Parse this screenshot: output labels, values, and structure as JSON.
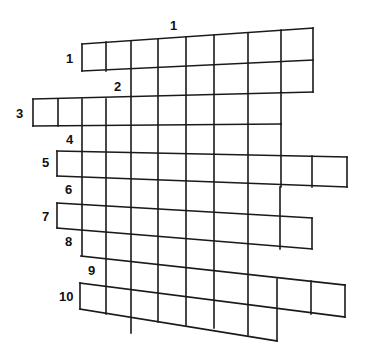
{
  "puzzle": {
    "type": "crossword",
    "stroke_color": "#1a1a1a",
    "background": "#ffffff"
  },
  "labels": [
    {
      "id": "v1",
      "text": "1",
      "direction": "vertical",
      "x": 170,
      "y": 19
    },
    {
      "id": "h1",
      "text": "1",
      "direction": "horizontal",
      "x": 66,
      "y": 52
    },
    {
      "id": "v2",
      "text": "2",
      "direction": "vertical",
      "x": 114,
      "y": 80
    },
    {
      "id": "h3",
      "text": "3",
      "direction": "horizontal",
      "x": 16,
      "y": 107
    },
    {
      "id": "h4",
      "text": "4",
      "direction": "horizontal",
      "x": 66,
      "y": 133
    },
    {
      "id": "h5",
      "text": "5",
      "direction": "horizontal",
      "x": 42,
      "y": 156
    },
    {
      "id": "h6",
      "text": "6",
      "direction": "horizontal",
      "x": 65,
      "y": 183
    },
    {
      "id": "h7",
      "text": "7",
      "direction": "horizontal",
      "x": 42,
      "y": 210
    },
    {
      "id": "h8",
      "text": "8",
      "direction": "horizontal",
      "x": 65,
      "y": 235
    },
    {
      "id": "h9",
      "text": "9",
      "direction": "horizontal",
      "x": 88,
      "y": 264
    },
    {
      "id": "h10",
      "text": "10",
      "direction": "horizontal",
      "x": 59,
      "y": 290
    }
  ],
  "grid_lines": {
    "horizontal": [
      [
        82,
        44,
        313,
        28
      ],
      [
        82,
        71,
        313,
        60
      ],
      [
        33,
        99,
        313,
        92
      ],
      [
        33,
        126,
        281,
        124
      ],
      [
        57,
        151,
        347,
        157
      ],
      [
        57,
        176,
        347,
        187
      ],
      [
        57,
        203,
        312,
        218
      ],
      [
        57,
        228,
        312,
        249
      ],
      [
        81,
        256,
        345,
        285
      ],
      [
        80,
        283,
        345,
        317
      ],
      [
        80,
        309,
        277,
        341
      ]
    ],
    "vertical": [
      [
        82,
        44,
        82,
        71
      ],
      [
        106,
        42,
        106,
        71
      ],
      [
        131,
        41,
        131,
        333
      ],
      [
        158,
        39,
        158,
        322
      ],
      [
        186,
        37,
        186,
        325
      ],
      [
        214,
        35,
        214,
        328
      ],
      [
        248,
        33,
        248,
        335
      ],
      [
        281,
        30,
        281,
        92
      ],
      [
        313,
        28,
        313,
        92
      ],
      [
        33,
        99,
        33,
        126
      ],
      [
        58,
        99,
        58,
        126
      ],
      [
        82,
        99,
        82,
        256
      ],
      [
        106,
        99,
        106,
        314
      ],
      [
        281,
        92,
        281,
        124
      ],
      [
        57,
        151,
        57,
        176
      ],
      [
        281,
        124,
        281,
        187
      ],
      [
        312,
        156,
        312,
        187
      ],
      [
        347,
        157,
        347,
        187
      ],
      [
        57,
        203,
        57,
        228
      ],
      [
        280,
        187,
        280,
        249
      ],
      [
        312,
        218,
        312,
        249
      ],
      [
        80,
        283,
        80,
        309
      ],
      [
        277,
        279,
        277,
        341
      ],
      [
        311,
        281,
        311,
        314
      ],
      [
        345,
        285,
        345,
        317
      ]
    ]
  }
}
